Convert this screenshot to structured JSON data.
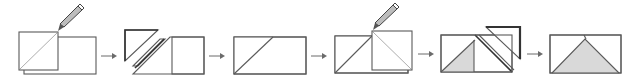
{
  "diagram": {
    "colors": {
      "fabric_gray": "#d9d9d9",
      "fabric_white": "#ffffff",
      "outline": "#5a5a5a",
      "seam_line": "#8a8a8a",
      "pencil": "#444444",
      "arrow": "#6b6b6b"
    },
    "steps": [
      {
        "index": 1,
        "label": "",
        "content": "white square on left of gray rectangle, pencil marking diagonal"
      },
      {
        "index": 2,
        "label": "",
        "content": "corner triangle trimmed away along stitched diagonal"
      },
      {
        "index": 3,
        "label": "",
        "content": "corner pressed open; rectangle with white triangle top-left"
      },
      {
        "index": 4,
        "label": "",
        "content": "second white square on right, pencil marking opposite diagonal"
      },
      {
        "index": 5,
        "label": "",
        "content": "second corner trimmed away"
      },
      {
        "index": 6,
        "label": "",
        "content": "finished flying-geese unit: gray triangle between two white corners"
      }
    ],
    "arrows": 5
  }
}
